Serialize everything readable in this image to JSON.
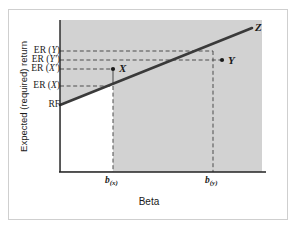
{
  "figure": {
    "type": "security-market-line-diagram",
    "axes": {
      "y_title": "Expected (required) return",
      "x_title": "Beta"
    },
    "y_tick_labels": [
      {
        "key": "er_y",
        "text": "ER (Y)",
        "prefix": "ER (",
        "symbol": "Y",
        "suffix": ")",
        "y_value": 51
      },
      {
        "key": "er_yp",
        "text": "ER (Y')",
        "prefix": "ER (",
        "symbol": "Y'",
        "suffix": ")",
        "y_value": 60
      },
      {
        "key": "er_xp",
        "text": "ER (X')",
        "prefix": "ER (",
        "symbol": "X'",
        "suffix": ")",
        "y_value": 69
      },
      {
        "key": "er_x",
        "text": "ER (X)",
        "prefix": "ER (",
        "symbol": "X",
        "suffix": ")",
        "y_value": 86
      }
    ],
    "intercept_label": "RF",
    "x_tick_labels": [
      {
        "key": "b_x",
        "base": "b",
        "sub": "(x)",
        "x_value": 113
      },
      {
        "key": "b_y",
        "base": "b",
        "sub": "(y)",
        "x_value": 213
      }
    ],
    "points": [
      {
        "key": "point_x",
        "label": "X",
        "x": 113,
        "y": 69,
        "marker": true
      },
      {
        "key": "point_y",
        "label": "Y",
        "x": 222,
        "y": 60,
        "marker": true
      },
      {
        "key": "point_z",
        "label": "Z",
        "x": 255,
        "y": 27,
        "marker": false
      }
    ],
    "sml_line": {
      "x1": 60,
      "y1": 105,
      "x2": 252,
      "y2": 28
    },
    "colors": {
      "shaded_region": "#d2d2d2",
      "line": "#333333",
      "axis": "#222222",
      "dashed": "#555555",
      "frame": "#cfcfcf",
      "text": "#1a1a1a"
    }
  }
}
